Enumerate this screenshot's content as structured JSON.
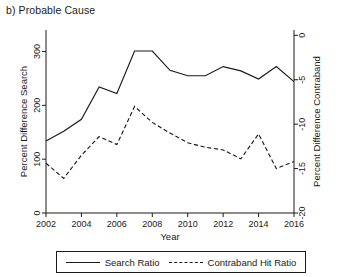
{
  "panel": {
    "title": "b) Probable Cause"
  },
  "legend": {
    "items": [
      {
        "label": "Search Ratio",
        "style": "solid",
        "name": "legend-item-search-ratio"
      },
      {
        "label": "Contraband Hit Ratio",
        "style": "dashed",
        "name": "legend-item-contraband-hit-ratio"
      }
    ]
  },
  "chart_data": {
    "type": "line",
    "title": "b) Probable Cause",
    "xlabel": "Year",
    "ylabel": "Percent Difference Search",
    "y2label": "Percent Difference Contraband",
    "grid": false,
    "legend_position": "bottom",
    "xlim": [
      2002,
      2016
    ],
    "ylim": [
      0,
      340
    ],
    "y2lim": [
      -20,
      0.6
    ],
    "xticks": [
      2002,
      2004,
      2006,
      2008,
      2010,
      2012,
      2014,
      2016
    ],
    "xticklabels": [
      "2002",
      "2004",
      "2006",
      "2008",
      "2010",
      "2012",
      "2014",
      "2016"
    ],
    "yticks": [
      0,
      100,
      200,
      300
    ],
    "yticklabels": [
      "0",
      "100",
      "200",
      "300"
    ],
    "y2ticks": [
      0,
      -5,
      -10,
      -15,
      -20
    ],
    "y2ticklabels": [
      "0",
      "-5",
      "-10",
      "-15",
      "-20"
    ],
    "x": [
      2002,
      2003,
      2004,
      2005,
      2006,
      2007,
      2008,
      2009,
      2010,
      2011,
      2012,
      2013,
      2014,
      2015,
      2016
    ],
    "series": [
      {
        "name": "Search Ratio",
        "axis": "left",
        "style": "solid",
        "values": [
          134,
          152,
          174,
          234,
          222,
          301,
          301,
          265,
          255,
          255,
          272,
          264,
          249,
          272,
          244
        ]
      },
      {
        "name": "Contraband Hit Ratio",
        "axis": "right",
        "style": "dashed",
        "values": [
          -14.4,
          -16.1,
          -13.5,
          -11.4,
          -12.3,
          -8.0,
          -9.8,
          -11.0,
          -12.1,
          -12.6,
          -12.9,
          -13.9,
          -11.1,
          -15.0,
          -14.2
        ]
      }
    ]
  }
}
